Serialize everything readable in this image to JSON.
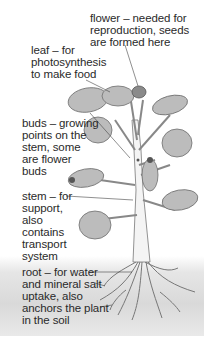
{
  "diagram": {
    "labels": [
      {
        "id": "flower",
        "text": "flower – needed for\nreproduction, seeds\nare formed here"
      },
      {
        "id": "leaf",
        "text": "leaf – for\nphotosynthesis\nto make food"
      },
      {
        "id": "buds",
        "text": "buds – growing\npoints on the\nstem, some\nare flower\nbuds"
      },
      {
        "id": "stem",
        "text": "stem – for\nsupport,\nalso\ncontains\ntransport\nsystem"
      },
      {
        "id": "root",
        "text": "root – for water\nand mineral salt\nuptake, also\nanchors the plant\nin the soil"
      }
    ],
    "colors": {
      "leaf_fill": "#b9b9b9",
      "leaf_edge": "#6e6e6e",
      "flower_fill": "#8a8a8a",
      "bud_fill": "#555555",
      "stem_fill": "#f2f2f2",
      "soil": "#d9d9d9",
      "leader_line": "#444444"
    }
  }
}
